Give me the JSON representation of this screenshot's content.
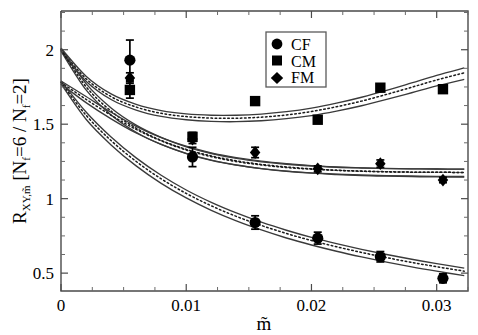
{
  "chart_data": {
    "type": "scatter",
    "title": "",
    "xlabel": "m̃",
    "ylabel": "R_{XY,m̃} [N_f=6 / N_f=2]",
    "ylabel_parts": {
      "main": "R",
      "subscript": "XY,m̃",
      "bracket_open": " [N",
      "sub_f1": "f",
      "mid": "=6 / N",
      "sub_f2": "f",
      "bracket_close": "=2]"
    },
    "xlim": [
      0,
      0.0325
    ],
    "ylim": [
      0.38,
      2.26
    ],
    "grid": false,
    "xticks": [
      0,
      0.01,
      0.02,
      0.03
    ],
    "xticklabels": [
      "0",
      "0.01",
      "0.02",
      "0.03"
    ],
    "xminorticks": [
      0.0025,
      0.005,
      0.0075,
      0.0125,
      0.015,
      0.0175,
      0.0225,
      0.025,
      0.0275,
      0.0325
    ],
    "yticks": [
      0.5,
      1,
      1.5,
      2
    ],
    "yticklabels": [
      "0.5",
      "1",
      "1.5",
      "2"
    ],
    "yminorticks": [
      0.625,
      0.75,
      0.875,
      1.125,
      1.25,
      1.375,
      1.625,
      1.75,
      1.875,
      2.125,
      2.25
    ],
    "legend": {
      "position": "top-right",
      "entries": [
        {
          "label": "CF",
          "marker": "circle"
        },
        {
          "label": "CM",
          "marker": "square"
        },
        {
          "label": "FM",
          "marker": "diamond"
        }
      ]
    },
    "series": [
      {
        "name": "CF",
        "marker": "circle",
        "x": [
          0.0055,
          0.0105,
          0.0155,
          0.0205,
          0.0255,
          0.0305
        ],
        "y": [
          1.93,
          1.28,
          0.84,
          0.735,
          0.61,
          0.465
        ],
        "yerr": [
          0.135,
          0.065,
          0.045,
          0.04,
          0.035,
          0.03
        ]
      },
      {
        "name": "CM",
        "marker": "square",
        "x": [
          0.0055,
          0.0105,
          0.0155,
          0.0205,
          0.0255,
          0.0305
        ],
        "y": [
          1.73,
          1.415,
          1.655,
          1.53,
          1.745,
          1.735
        ],
        "yerr": [
          0.055,
          0.03,
          0.02,
          0.018,
          0.015,
          0.015
        ]
      },
      {
        "name": "FM",
        "marker": "diamond",
        "x": [
          0.0055,
          0.0105,
          0.0155,
          0.0205,
          0.0255,
          0.0305
        ],
        "y": [
          1.81,
          1.4,
          1.31,
          1.2,
          1.235,
          1.125
        ],
        "yerr": [
          0.035,
          0.03,
          0.035,
          0.02,
          0.025,
          0.018
        ]
      }
    ],
    "fit_bands": [
      {
        "name": "CM-fit-upper",
        "y0": 2.0,
        "comment": "upper band, minimum near m=0.014 then rising",
        "center": [
          [
            0,
            2.0
          ],
          [
            0.002,
            1.805
          ],
          [
            0.004,
            1.685
          ],
          [
            0.006,
            1.615
          ],
          [
            0.008,
            1.573
          ],
          [
            0.01,
            1.551
          ],
          [
            0.012,
            1.541
          ],
          [
            0.014,
            1.54
          ],
          [
            0.016,
            1.547
          ],
          [
            0.018,
            1.562
          ],
          [
            0.02,
            1.585
          ],
          [
            0.022,
            1.617
          ],
          [
            0.024,
            1.655
          ],
          [
            0.026,
            1.7
          ],
          [
            0.028,
            1.748
          ],
          [
            0.03,
            1.797
          ],
          [
            0.0322,
            1.845
          ]
        ],
        "upper": [
          [
            0,
            2.01
          ],
          [
            0.002,
            1.822
          ],
          [
            0.004,
            1.703
          ],
          [
            0.006,
            1.633
          ],
          [
            0.008,
            1.591
          ],
          [
            0.01,
            1.569
          ],
          [
            0.012,
            1.56
          ],
          [
            0.014,
            1.56
          ],
          [
            0.016,
            1.568
          ],
          [
            0.018,
            1.584
          ],
          [
            0.02,
            1.608
          ],
          [
            0.022,
            1.641
          ],
          [
            0.024,
            1.681
          ],
          [
            0.026,
            1.727
          ],
          [
            0.028,
            1.777
          ],
          [
            0.03,
            1.828
          ],
          [
            0.0322,
            1.878
          ]
        ],
        "lower": [
          [
            0,
            1.99
          ],
          [
            0.002,
            1.789
          ],
          [
            0.004,
            1.666
          ],
          [
            0.006,
            1.595
          ],
          [
            0.008,
            1.552
          ],
          [
            0.01,
            1.53
          ],
          [
            0.012,
            1.519
          ],
          [
            0.014,
            1.517
          ],
          [
            0.016,
            1.523
          ],
          [
            0.018,
            1.537
          ],
          [
            0.02,
            1.558
          ],
          [
            0.022,
            1.588
          ],
          [
            0.024,
            1.624
          ],
          [
            0.026,
            1.666
          ],
          [
            0.028,
            1.711
          ],
          [
            0.03,
            1.757
          ],
          [
            0.0322,
            1.801
          ]
        ]
      },
      {
        "name": "FM-fit-middle",
        "y0": 2.0,
        "comment": "middle band decaying to plateau near 1.17",
        "center": [
          [
            0,
            2.0
          ],
          [
            0.002,
            1.752
          ],
          [
            0.004,
            1.588
          ],
          [
            0.006,
            1.473
          ],
          [
            0.008,
            1.391
          ],
          [
            0.01,
            1.331
          ],
          [
            0.012,
            1.287
          ],
          [
            0.014,
            1.254
          ],
          [
            0.016,
            1.23
          ],
          [
            0.018,
            1.213
          ],
          [
            0.02,
            1.2
          ],
          [
            0.022,
            1.191
          ],
          [
            0.024,
            1.185
          ],
          [
            0.026,
            1.181
          ],
          [
            0.028,
            1.178
          ],
          [
            0.03,
            1.177
          ],
          [
            0.0322,
            1.176
          ]
        ],
        "upper": [
          [
            0,
            2.01
          ],
          [
            0.002,
            1.772
          ],
          [
            0.004,
            1.609
          ],
          [
            0.006,
            1.494
          ],
          [
            0.008,
            1.412
          ],
          [
            0.01,
            1.352
          ],
          [
            0.012,
            1.308
          ],
          [
            0.014,
            1.276
          ],
          [
            0.016,
            1.252
          ],
          [
            0.018,
            1.235
          ],
          [
            0.02,
            1.222
          ],
          [
            0.022,
            1.213
          ],
          [
            0.024,
            1.207
          ],
          [
            0.026,
            1.203
          ],
          [
            0.028,
            1.2
          ],
          [
            0.03,
            1.199
          ],
          [
            0.0322,
            1.198
          ]
        ],
        "lower": [
          [
            0,
            1.99
          ],
          [
            0.002,
            1.73
          ],
          [
            0.004,
            1.562
          ],
          [
            0.006,
            1.446
          ],
          [
            0.008,
            1.364
          ],
          [
            0.01,
            1.304
          ],
          [
            0.012,
            1.259
          ],
          [
            0.014,
            1.226
          ],
          [
            0.016,
            1.202
          ],
          [
            0.018,
            1.184
          ],
          [
            0.02,
            1.171
          ],
          [
            0.022,
            1.162
          ],
          [
            0.024,
            1.155
          ],
          [
            0.026,
            1.151
          ],
          [
            0.028,
            1.148
          ],
          [
            0.03,
            1.146
          ],
          [
            0.0322,
            1.145
          ]
        ]
      },
      {
        "name": "FM-fit-middle-b",
        "y0": 1.78,
        "comment": "second middle band starting lower at m=0 merging with middle",
        "center": [
          [
            0,
            1.78
          ],
          [
            0.002,
            1.667
          ],
          [
            0.004,
            1.56
          ],
          [
            0.006,
            1.465
          ],
          [
            0.008,
            1.388
          ],
          [
            0.01,
            1.327
          ],
          [
            0.012,
            1.282
          ],
          [
            0.014,
            1.249
          ],
          [
            0.016,
            1.226
          ],
          [
            0.018,
            1.209
          ],
          [
            0.02,
            1.198
          ],
          [
            0.022,
            1.19
          ],
          [
            0.024,
            1.184
          ],
          [
            0.026,
            1.18
          ],
          [
            0.028,
            1.178
          ],
          [
            0.03,
            1.177
          ],
          [
            0.0322,
            1.176
          ]
        ],
        "upper": [
          [
            0,
            1.79
          ],
          [
            0.002,
            1.686
          ],
          [
            0.004,
            1.58
          ],
          [
            0.006,
            1.486
          ],
          [
            0.008,
            1.409
          ],
          [
            0.01,
            1.348
          ],
          [
            0.012,
            1.303
          ],
          [
            0.014,
            1.27
          ],
          [
            0.016,
            1.247
          ],
          [
            0.018,
            1.231
          ],
          [
            0.02,
            1.219
          ],
          [
            0.022,
            1.211
          ],
          [
            0.024,
            1.206
          ],
          [
            0.026,
            1.202
          ],
          [
            0.028,
            1.2
          ],
          [
            0.03,
            1.199
          ],
          [
            0.0322,
            1.198
          ]
        ],
        "lower": [
          [
            0,
            1.77
          ],
          [
            0.002,
            1.645
          ],
          [
            0.004,
            1.536
          ],
          [
            0.006,
            1.441
          ],
          [
            0.008,
            1.364
          ],
          [
            0.01,
            1.303
          ],
          [
            0.012,
            1.257
          ],
          [
            0.014,
            1.225
          ],
          [
            0.016,
            1.202
          ],
          [
            0.018,
            1.185
          ],
          [
            0.02,
            1.173
          ],
          [
            0.022,
            1.165
          ],
          [
            0.024,
            1.159
          ],
          [
            0.026,
            1.155
          ],
          [
            0.028,
            1.152
          ],
          [
            0.03,
            1.15
          ],
          [
            0.0322,
            1.149
          ]
        ]
      },
      {
        "name": "CF-fit-lower",
        "y0": 1.78,
        "comment": "lower band decaying toward 0.45",
        "center": [
          [
            0,
            1.78
          ],
          [
            0.002,
            1.56
          ],
          [
            0.004,
            1.39
          ],
          [
            0.006,
            1.25
          ],
          [
            0.008,
            1.133
          ],
          [
            0.01,
            1.035
          ],
          [
            0.012,
            0.952
          ],
          [
            0.014,
            0.881
          ],
          [
            0.016,
            0.82
          ],
          [
            0.018,
            0.766
          ],
          [
            0.02,
            0.719
          ],
          [
            0.022,
            0.677
          ],
          [
            0.024,
            0.639
          ],
          [
            0.026,
            0.604
          ],
          [
            0.028,
            0.572
          ],
          [
            0.03,
            0.543
          ],
          [
            0.0322,
            0.513
          ]
        ],
        "upper": [
          [
            0,
            1.79
          ],
          [
            0.002,
            1.582
          ],
          [
            0.004,
            1.414
          ],
          [
            0.006,
            1.274
          ],
          [
            0.008,
            1.157
          ],
          [
            0.01,
            1.058
          ],
          [
            0.012,
            0.975
          ],
          [
            0.014,
            0.904
          ],
          [
            0.016,
            0.842
          ],
          [
            0.018,
            0.788
          ],
          [
            0.02,
            0.74
          ],
          [
            0.022,
            0.698
          ],
          [
            0.024,
            0.66
          ],
          [
            0.026,
            0.625
          ],
          [
            0.028,
            0.593
          ],
          [
            0.03,
            0.564
          ],
          [
            0.0322,
            0.534
          ]
        ],
        "lower": [
          [
            0,
            1.77
          ],
          [
            0.002,
            1.533
          ],
          [
            0.004,
            1.361
          ],
          [
            0.006,
            1.22
          ],
          [
            0.008,
            1.103
          ],
          [
            0.01,
            1.005
          ],
          [
            0.012,
            0.922
          ],
          [
            0.014,
            0.851
          ],
          [
            0.016,
            0.79
          ],
          [
            0.018,
            0.736
          ],
          [
            0.02,
            0.689
          ],
          [
            0.022,
            0.647
          ],
          [
            0.024,
            0.609
          ],
          [
            0.026,
            0.574
          ],
          [
            0.028,
            0.542
          ],
          [
            0.03,
            0.513
          ],
          [
            0.0322,
            0.483
          ]
        ]
      }
    ]
  },
  "axes": {
    "y_tick_0": "0.5",
    "y_tick_1": "1",
    "y_tick_2": "1.5",
    "y_tick_3": "2",
    "x_tick_0": "0",
    "x_tick_1": "0.01",
    "x_tick_2": "0.02",
    "x_tick_3": "0.03",
    "x_axis_title": "m̃"
  },
  "ylabel_text": {
    "r": "R",
    "sub": "XY,m̃",
    "open": "[N",
    "f1": "f",
    "eq6": "=6 / N",
    "f2": "f",
    "eq2": "=2]"
  },
  "legend_labels": {
    "cf": "CF",
    "cm": "CM",
    "fm": "FM"
  },
  "colors": {
    "ink": "#000000",
    "frame": "#4a4a4a",
    "band_edge": "#3a3a3a",
    "background": "#ffffff"
  }
}
